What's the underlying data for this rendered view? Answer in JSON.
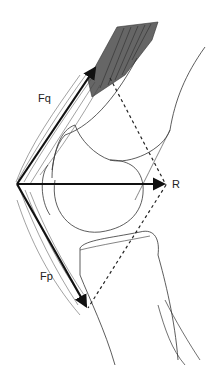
{
  "diagram": {
    "type": "knee-force-diagram",
    "labels": {
      "quadriceps_force": "Fq",
      "patellar_force": "Fp",
      "resultant": "R"
    },
    "colors": {
      "line": "#222222",
      "muscle_fill": "#666666",
      "background": "#ffffff"
    }
  }
}
